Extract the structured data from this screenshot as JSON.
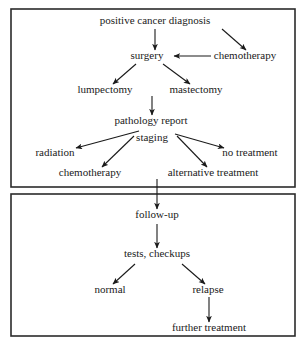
{
  "diagram": {
    "background_color": "#ffffff",
    "line_color": "#1a1a1a",
    "box_border_color": "#2b2b2b",
    "phases": [
      {
        "id": "treatment-phase",
        "x": 11,
        "y": 9,
        "width": 284,
        "height": 178
      },
      {
        "id": "followup-phase",
        "x": 11,
        "y": 194,
        "width": 284,
        "height": 142
      }
    ],
    "nodes": [
      {
        "id": "positive-cancer-diagnosis",
        "label": "positive cancer diagnosis",
        "x": 155,
        "y": 24
      },
      {
        "id": "surgery",
        "label": "surgery",
        "x": 147,
        "y": 59
      },
      {
        "id": "chemotherapy-initial",
        "label": "chemotherapy",
        "x": 245,
        "y": 59
      },
      {
        "id": "lumpectomy",
        "label": "lumpectomy",
        "x": 105,
        "y": 93
      },
      {
        "id": "mastectomy",
        "label": "mastectomy",
        "x": 196,
        "y": 93
      },
      {
        "id": "pathology-report",
        "label": "pathology report",
        "x": 151,
        "y": 124
      },
      {
        "id": "staging",
        "label": "staging",
        "x": 152,
        "y": 141
      },
      {
        "id": "radiation",
        "label": "radiation",
        "x": 55,
        "y": 156
      },
      {
        "id": "no-treatment",
        "label": "no treatment",
        "x": 250,
        "y": 156
      },
      {
        "id": "chemotherapy-adjuvant",
        "label": "chemotherapy",
        "x": 90,
        "y": 176
      },
      {
        "id": "alternative-treatment",
        "label": "alternative treatment",
        "x": 213,
        "y": 176
      },
      {
        "id": "follow-up",
        "label": "follow-up",
        "x": 157,
        "y": 218
      },
      {
        "id": "tests-checkups",
        "label": "tests, checkups",
        "x": 157,
        "y": 257
      },
      {
        "id": "normal",
        "label": "normal",
        "x": 110,
        "y": 293
      },
      {
        "id": "relapse",
        "label": "relapse",
        "x": 208,
        "y": 293
      },
      {
        "id": "further-treatment",
        "label": "further treatment",
        "x": 209,
        "y": 331
      }
    ],
    "edges": [
      {
        "id": "edge-diagnosis-surgery",
        "from": "positive-cancer-diagnosis",
        "to": "surgery",
        "x1": 155,
        "y1": 29,
        "x2": 155,
        "y2": 50
      },
      {
        "id": "edge-diagnosis-chemotherapy",
        "from": "positive-cancer-diagnosis",
        "to": "chemotherapy-initial",
        "x1": 222,
        "y1": 29,
        "x2": 246,
        "y2": 50
      },
      {
        "id": "edge-chemotherapy-surgery",
        "from": "chemotherapy-initial",
        "to": "surgery",
        "x1": 211,
        "y1": 56,
        "x2": 174,
        "y2": 56
      },
      {
        "id": "edge-surgery-lumpectomy",
        "from": "surgery",
        "to": "lumpectomy",
        "x1": 136,
        "y1": 64,
        "x2": 113,
        "y2": 84
      },
      {
        "id": "edge-surgery-mastectomy",
        "from": "surgery",
        "to": "mastectomy",
        "x1": 163,
        "y1": 64,
        "x2": 190,
        "y2": 84
      },
      {
        "id": "edge-mastectomy-pathology",
        "from": "mastectomy",
        "to": "pathology-report",
        "x1": 152,
        "y1": 96,
        "x2": 152,
        "y2": 115
      },
      {
        "id": "edge-staging-radiation",
        "from": "staging",
        "to": "radiation",
        "x1": 139,
        "y1": 131,
        "x2": 76,
        "y2": 148
      },
      {
        "id": "edge-staging-chemotherapy",
        "from": "staging",
        "to": "chemotherapy-adjuvant",
        "x1": 134,
        "y1": 136,
        "x2": 102,
        "y2": 167
      },
      {
        "id": "edge-staging-no-treatment",
        "from": "staging",
        "to": "no-treatment",
        "x1": 175,
        "y1": 134,
        "x2": 224,
        "y2": 148
      },
      {
        "id": "edge-staging-alternative",
        "from": "staging",
        "to": "alternative-treatment",
        "x1": 177,
        "y1": 136,
        "x2": 207,
        "y2": 167
      },
      {
        "id": "edge-alternative-followup",
        "from": "alternative-treatment",
        "to": "follow-up",
        "x1": 157,
        "y1": 179,
        "x2": 157,
        "y2": 209
      },
      {
        "id": "edge-followup-tests",
        "from": "follow-up",
        "to": "tests-checkups",
        "x1": 157,
        "y1": 224,
        "x2": 157,
        "y2": 248
      },
      {
        "id": "edge-tests-normal",
        "from": "tests-checkups",
        "to": "normal",
        "x1": 135,
        "y1": 264,
        "x2": 113,
        "y2": 284
      },
      {
        "id": "edge-tests-relapse",
        "from": "tests-checkups",
        "to": "relapse",
        "x1": 182,
        "y1": 264,
        "x2": 205,
        "y2": 284
      },
      {
        "id": "edge-relapse-further",
        "from": "relapse",
        "to": "further-treatment",
        "x1": 209,
        "y1": 297,
        "x2": 209,
        "y2": 322
      }
    ]
  }
}
